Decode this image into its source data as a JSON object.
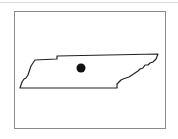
{
  "map": {
    "region": "Tennessee",
    "marker": {
      "label": "Location marker",
      "cx": 81,
      "cy": 68,
      "r": 4.5,
      "color": "#111111"
    },
    "outline_color": "#222222",
    "frame_color": "#8a8a8a"
  }
}
